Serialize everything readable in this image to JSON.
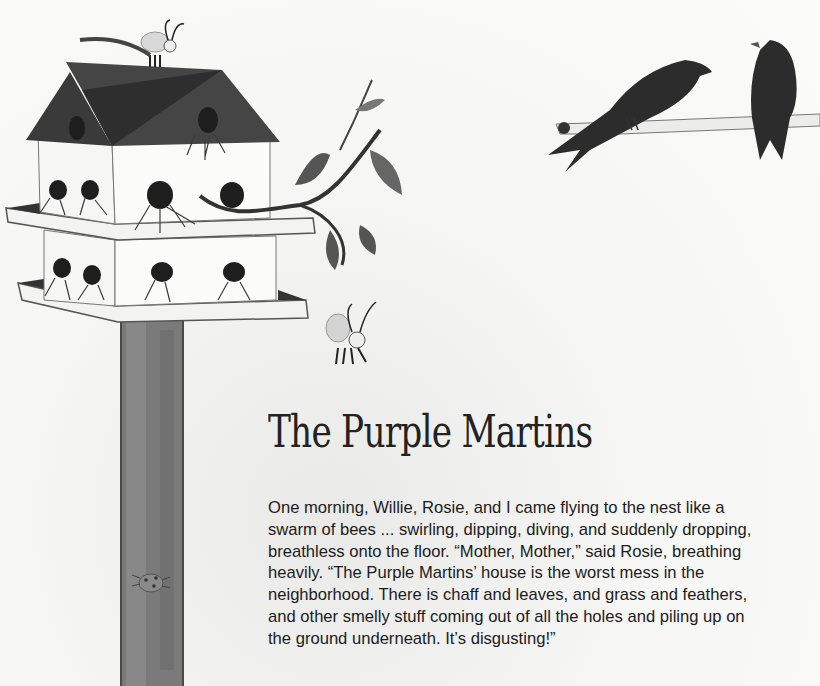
{
  "page": {
    "title": "The Purple Martins",
    "body_lines": [
      "One morning, Willie, Rosie, and I came flying to the nest like a",
      "swarm of bees ... swirling, dipping, diving, and suddenly dropping,",
      "breathless onto the floor. “Mother, Mother,” said Rosie, breathing",
      "heavily. “The Purple Martins’ house is the worst mess in the",
      "neighborhood. There is chaff and leaves, and grass and feathers,",
      "and other smelly stuff coming out of all the holes and piling up on",
      "the ground underneath. It’s disgusting!”"
    ]
  },
  "illustrations": {
    "birdhouse": "martin-birdhouse-illustration",
    "birds": "two-martins-on-branch-illustration",
    "bees": "bee-characters",
    "ladybug": "ladybug-on-pole"
  },
  "colors": {
    "ink": "#222222",
    "roof": "#3a3a3a",
    "background": "#f7f7f5"
  }
}
